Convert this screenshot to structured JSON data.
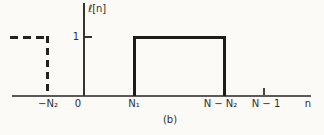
{
  "figure": {
    "y_axis_label": "ℓ[n]",
    "y_tick_1": "1",
    "tick_neg_n2": "−N₂",
    "tick_zero": "0",
    "tick_n1": "N₁",
    "tick_n_minus_n2": "N − N₂",
    "tick_n_minus_1": "N − 1",
    "x_axis_label": "n",
    "caption": "(b)"
  },
  "colors": {
    "background": "#fbfaf7",
    "axis": "#5a5a58",
    "pulse_line": "#1c1c1a",
    "dashed_line": "#222220",
    "text": "#2e2e2e"
  },
  "chart_data": {
    "type": "line",
    "subtype": "discrete-time rectangular pulse (step outline)",
    "title": "",
    "xlabel": "n",
    "ylabel": "ℓ[n]",
    "x_tick_labels": [
      "−N₂",
      "0",
      "N₁",
      "N − N₂",
      "N − 1"
    ],
    "y_tick_labels": [
      "1"
    ],
    "ylim": [
      0,
      1.6
    ],
    "grid": false,
    "legend": false,
    "caption": "(b)",
    "series": [
      {
        "name": "main-pulse",
        "style": "solid",
        "value": 1,
        "description": "ℓ[n] = 1 for N₁ ≤ n ≤ N − N₂, 0 elsewhere; drawn as rectangle outline of height 1 from N₁ to N − N₂ sitting on the n-axis",
        "points_symbolic": [
          {
            "x": "N₁",
            "y": 0
          },
          {
            "x": "N₁",
            "y": 1
          },
          {
            "x": "N − N₂",
            "y": 1
          },
          {
            "x": "N − N₂",
            "y": 0
          }
        ]
      },
      {
        "name": "periodic-extension",
        "style": "dashed",
        "value": 1,
        "description": "dashed copy of the pulse at height 1 entering from the left edge of the plot and dropping to 0 at n = −N₂",
        "points_symbolic": [
          {
            "x": "left-edge",
            "y": 1
          },
          {
            "x": "−N₂",
            "y": 1
          },
          {
            "x": "−N₂",
            "y": 0
          }
        ]
      }
    ],
    "extra_marks": [
      {
        "type": "axis-tick",
        "x": "N − 1",
        "note": "short tick above axis at N − 1"
      },
      {
        "type": "axis-tick",
        "y": 1,
        "note": "short tick right of vertical axis at height 1"
      }
    ]
  }
}
